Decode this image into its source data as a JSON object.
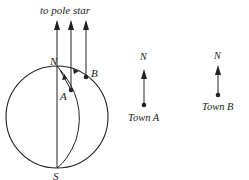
{
  "diagram": {
    "pole_star_label": "to pole star",
    "globe": {
      "north_label": "N",
      "south_label": "S",
      "point_a_label": "A",
      "point_b_label": "B"
    },
    "town_a": {
      "north_label": "N",
      "name": "Town A"
    },
    "town_b": {
      "north_label": "N",
      "name": "Town B"
    },
    "colors": {
      "ink": "#222222",
      "background": "#ffffff"
    }
  }
}
